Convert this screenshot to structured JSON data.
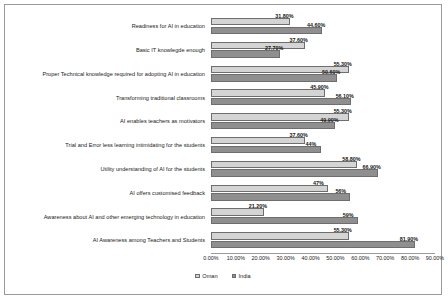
{
  "chart_data": {
    "type": "bar",
    "orientation": "horizontal",
    "title": "",
    "xlabel": "",
    "ylabel": "",
    "xlim": [
      0,
      90
    ],
    "xticks": [
      "0.00%",
      "10.00%",
      "20.00%",
      "30.00%",
      "40.00%",
      "50.00%",
      "60.00%",
      "70.00%",
      "80.00%",
      "90.00%"
    ],
    "xtick_values": [
      0,
      10,
      20,
      30,
      40,
      50,
      60,
      70,
      80,
      90
    ],
    "grid": false,
    "legend_position": "bottom",
    "categories": [
      "Readiness for AI in education",
      "Basic IT knowlegde enough",
      "Proper Technical knowledge required for adopting AI in education",
      "Transforming traditional classrooms",
      "AI enables teachers as motivators",
      "Trial and Error less learning intimidating for the students",
      "Utility understanding of AI for the students",
      "AI offers customised feedback",
      "Awareness about AI and other emerging technology in education",
      "AI Awareness among Teachers and Students"
    ],
    "series": [
      {
        "name": "Oman",
        "color": "#d4d4d4",
        "values": [
          31.8,
          37.6,
          55.3,
          45.9,
          55.3,
          37.6,
          58.8,
          47.0,
          21.2,
          55.3
        ],
        "labels": [
          "31.80%",
          "37.60%",
          "55.30%",
          "45.90%",
          "55.30%",
          "37.60%",
          "58.80%",
          "47%",
          "21.20%",
          "55.30%"
        ]
      },
      {
        "name": "India",
        "color": "#8f8f8f",
        "values": [
          44.6,
          27.7,
          50.6,
          56.1,
          49.9,
          44.0,
          66.9,
          56.0,
          59.0,
          81.9
        ],
        "labels": [
          "44.60%",
          "27.70%",
          "50.60%",
          "56.10%",
          "49.90%",
          "44%",
          "66.90%",
          "56%",
          "59%",
          "81.90%"
        ]
      }
    ]
  },
  "legend": {
    "items": [
      {
        "label": "Oman",
        "color": "#d4d4d4"
      },
      {
        "label": "India",
        "color": "#8f8f8f"
      }
    ]
  }
}
